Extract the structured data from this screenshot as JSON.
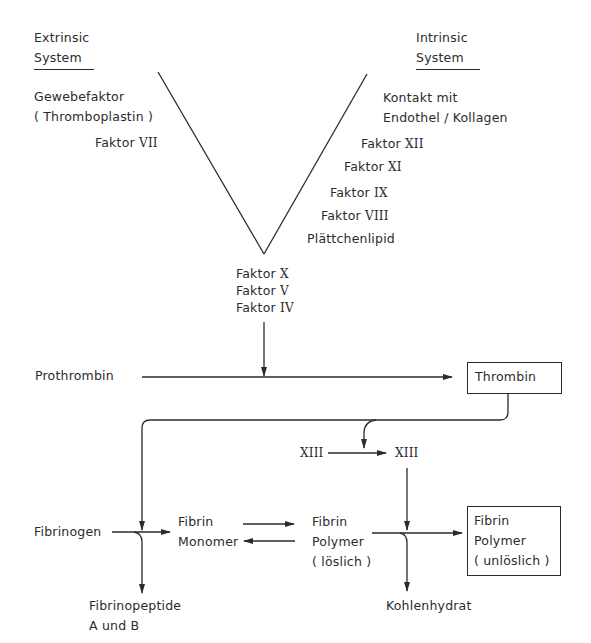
{
  "diagram": {
    "extrinsic": {
      "title_line1": "Extrinsic",
      "title_line2": "System",
      "gewebefaktor": "Gewebefaktor",
      "thromboplastin": "( Thromboplastin )",
      "faktor_vii": {
        "label": "Faktor",
        "numeral": "VII"
      }
    },
    "intrinsic": {
      "title_line1": "Intrinsic",
      "title_line2": "System",
      "kontakt_line1": "Kontakt mit",
      "kontakt_line2": "Endothel / Kollagen",
      "faktor_xii": {
        "label": "Faktor",
        "numeral": "XII"
      },
      "faktor_xi": {
        "label": "Faktor",
        "numeral": "XI"
      },
      "faktor_ix": {
        "label": "Faktor",
        "numeral": "IX"
      },
      "faktor_viii": {
        "label": "Faktor",
        "numeral": "VIII"
      },
      "plaettchenlipid": "Plättchenlipid"
    },
    "common": {
      "faktor_x": {
        "label": "Faktor",
        "numeral": "X"
      },
      "faktor_v": {
        "label": "Faktor",
        "numeral": "V"
      },
      "faktor_iv": {
        "label": "Faktor",
        "numeral": "IV"
      }
    },
    "prothrombin": "Prothrombin",
    "thrombin": "Thrombin",
    "xiii_inactive": "XIII",
    "xiii_active": "XIII",
    "fibrinogen": "Fibrinogen",
    "fibrin_monomer": {
      "line1": "Fibrin",
      "line2": "Monomer"
    },
    "fibrin_polymer_soluble": {
      "line1": "Fibrin",
      "line2": "Polymer",
      "line3": "( löslich )"
    },
    "fibrin_polymer_insoluble": {
      "line1": "Fibrin",
      "line2": "Polymer",
      "line3": "( unlöslich )"
    },
    "fibrinopeptide": {
      "line1": "Fibrinopeptide",
      "line2": "A und B"
    },
    "kohlenhydrat": "Kohlenhydrat"
  }
}
